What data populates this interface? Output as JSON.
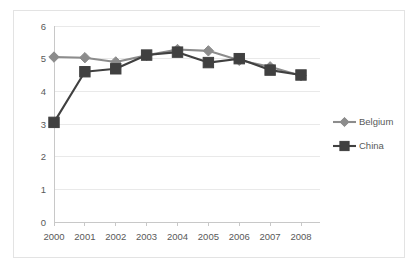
{
  "chart_data": {
    "type": "line",
    "title": "",
    "xlabel": "",
    "ylabel": "",
    "categories": [
      "2000",
      "2001",
      "2002",
      "2003",
      "2004",
      "2005",
      "2006",
      "2007",
      "2008"
    ],
    "x": [
      2000,
      2001,
      2002,
      2003,
      2004,
      2005,
      2006,
      2007,
      2008
    ],
    "series": [
      {
        "name": "Belgium",
        "color": "#8c8c8c",
        "marker": "diamond",
        "values": [
          5.05,
          5.03,
          4.9,
          5.1,
          5.28,
          5.24,
          4.95,
          4.75,
          4.48
        ]
      },
      {
        "name": "China",
        "color": "#404040",
        "marker": "square",
        "values": [
          3.05,
          4.6,
          4.69,
          5.11,
          5.2,
          4.88,
          5.0,
          4.65,
          4.5
        ]
      }
    ],
    "ylim": [
      0,
      6
    ],
    "yticks": [
      0,
      1,
      2,
      3,
      4,
      5,
      6
    ],
    "ytick_labels": [
      "0",
      "1",
      "2",
      "3",
      "4",
      "5",
      "6"
    ],
    "grid": true,
    "grid_axis": "y",
    "legend_position": "right",
    "legend_entries": [
      {
        "label": "Belgium",
        "color": "#8c8c8c",
        "marker": "diamond"
      },
      {
        "label": "China",
        "color": "#404040",
        "marker": "square"
      }
    ]
  },
  "figure": {
    "background_color": "#ffffff",
    "frame_color": "#e3e3e3",
    "gridline_color": "#e9e9e9",
    "axis_color": "#c8c8c8",
    "tick_text_color": "#595959"
  }
}
